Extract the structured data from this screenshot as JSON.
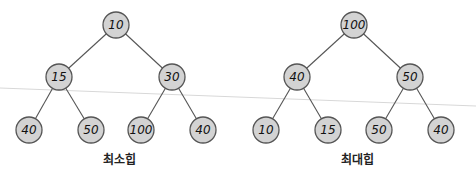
{
  "colors": {
    "node_fill": "#d3d3d3",
    "node_stroke": "#555555",
    "edge": "#555555",
    "text": "#111111",
    "divider_line": "#d8d8d8"
  },
  "min_heap": {
    "caption": "최소힙",
    "nodes": [
      {
        "id": "root",
        "value": "10"
      },
      {
        "id": "left",
        "value": "15"
      },
      {
        "id": "right",
        "value": "30"
      },
      {
        "id": "left-left",
        "value": "40"
      },
      {
        "id": "left-right",
        "value": "50"
      },
      {
        "id": "right-left",
        "value": "100"
      },
      {
        "id": "right-right",
        "value": "40"
      }
    ]
  },
  "max_heap": {
    "caption": "최대힙",
    "nodes": [
      {
        "id": "root",
        "value": "100"
      },
      {
        "id": "left",
        "value": "40"
      },
      {
        "id": "right",
        "value": "50"
      },
      {
        "id": "left-left",
        "value": "10"
      },
      {
        "id": "left-right",
        "value": "15"
      },
      {
        "id": "right-left",
        "value": "50"
      },
      {
        "id": "right-right",
        "value": "40"
      }
    ]
  }
}
